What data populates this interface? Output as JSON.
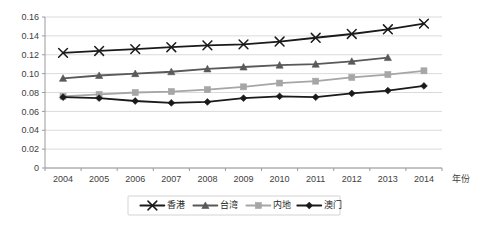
{
  "chart_data": {
    "type": "line",
    "title": "",
    "xlabel": "年份",
    "ylabel": "",
    "x": [
      2004,
      2005,
      2006,
      2007,
      2008,
      2009,
      2010,
      2011,
      2012,
      2013,
      2014
    ],
    "categories": [
      "2004",
      "2005",
      "2006",
      "2007",
      "2008",
      "2009",
      "2010",
      "2011",
      "2012",
      "2013",
      "2014"
    ],
    "ylim": [
      0,
      0.16
    ],
    "yticks": [
      0,
      0.02,
      0.04,
      0.06,
      0.08,
      0.1,
      0.12,
      0.14,
      0.16
    ],
    "ytick_labels": [
      "0",
      "0.02",
      "0.04",
      "0.06",
      "0.08",
      "0.10",
      "0.12",
      "0.14",
      "0.16"
    ],
    "grid": true,
    "legend_position": "bottom",
    "series": [
      {
        "name": "香港",
        "marker": "x-cross",
        "color": "#1a1a1a",
        "values": [
          0.122,
          0.124,
          0.126,
          0.128,
          0.13,
          0.131,
          0.134,
          0.138,
          0.142,
          0.147,
          0.153
        ]
      },
      {
        "name": "台湾",
        "marker": "triangle",
        "color": "#595959",
        "values": [
          0.095,
          0.098,
          0.1,
          0.102,
          0.105,
          0.107,
          0.109,
          0.11,
          0.113,
          0.117,
          null
        ]
      },
      {
        "name": "内地",
        "marker": "square",
        "color": "#a6a6a6",
        "values": [
          0.076,
          0.078,
          0.08,
          0.081,
          0.083,
          0.086,
          0.09,
          0.092,
          0.096,
          0.099,
          0.103
        ]
      },
      {
        "name": "澳门",
        "marker": "diamond",
        "color": "#1a1a1a",
        "values": [
          0.075,
          0.074,
          0.071,
          0.069,
          0.07,
          0.074,
          0.076,
          0.075,
          0.079,
          0.082,
          0.087
        ]
      }
    ]
  },
  "legend": {
    "items": [
      {
        "label": "香港"
      },
      {
        "label": "台湾"
      },
      {
        "label": "内地"
      },
      {
        "label": "澳门"
      }
    ]
  },
  "axes": {
    "x_axis_title": "年份"
  },
  "colors": {
    "gridline": "#d0d0d0",
    "axis": "#9a9a9a",
    "background": "#ffffff",
    "text": "#404040",
    "series_hongkong": "#1a1a1a",
    "series_taiwan": "#595959",
    "series_mainland": "#a6a6a6",
    "series_macau": "#1a1a1a"
  }
}
